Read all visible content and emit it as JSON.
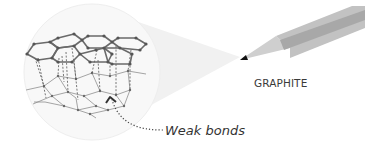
{
  "diagram": {
    "title_label": "GRAPHITE",
    "annotation_label": "Weak bonds",
    "colors": {
      "background": "#ffffff",
      "magnify_circle": "#f7f7f7",
      "magnify_cone": "#f0f0f0",
      "top_layer_bond": "#666666",
      "bottom_layer_bond": "#8a8a8a",
      "atom": "#5a5a5a",
      "pencil_body": "#c2c2c2",
      "pencil_stripe": "#a6a6a6",
      "pencil_tip": "#111111",
      "pencil_cone": "#cfcfcf"
    },
    "parts": [
      "magnifier-circle",
      "top-graphene-layer",
      "bottom-graphene-layer",
      "interlayer-dashed-bonds",
      "pointer-arrow",
      "pencil"
    ]
  }
}
